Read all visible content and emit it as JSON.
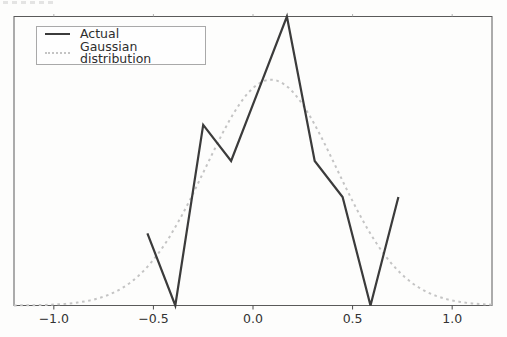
{
  "chart_data": {
    "type": "line",
    "title": "",
    "xlabel": "",
    "ylabel": "",
    "xlim": [
      -1.2,
      1.2
    ],
    "ylim": [
      0,
      8
    ],
    "x_ticks": [
      -1.0,
      -0.5,
      0.0,
      0.5,
      1.0
    ],
    "x_tick_labels": [
      "−1.0",
      "−0.5",
      "0.0",
      "0.5",
      "1.0"
    ],
    "y_tick_labels_visible": false,
    "grid": false,
    "legend": {
      "position": "upper left",
      "entries": [
        "Actual",
        "Gaussian distribution"
      ]
    },
    "series": [
      {
        "name": "Actual",
        "style": "solid",
        "color": "#3b3b3b",
        "linewidth": 2.2,
        "x": [
          -0.53,
          -0.39,
          -0.25,
          -0.11,
          0.03,
          0.17,
          0.31,
          0.45,
          0.59,
          0.73
        ],
        "y": [
          2,
          0,
          5,
          4,
          6,
          8,
          4,
          3,
          0,
          3
        ],
        "y_units": "relative; y-axis labels not visible in screenshot"
      },
      {
        "name": "Gaussian distribution",
        "style": "dotted",
        "color": "#c4c4c4",
        "linewidth": 2.0,
        "curve": "gaussian",
        "mu": 0.09,
        "sigma": 0.33,
        "amplitude": 6.25
      }
    ],
    "colors": {
      "frame": "#5a5a5a",
      "tick": "#4a4a4a",
      "top_tick": "#a0a0a0",
      "tick_text": "#333333",
      "background": "#fdfdfc"
    },
    "plot_box_px": {
      "left": 14,
      "top": 16.5,
      "right": 492,
      "bottom": 305.5
    }
  }
}
